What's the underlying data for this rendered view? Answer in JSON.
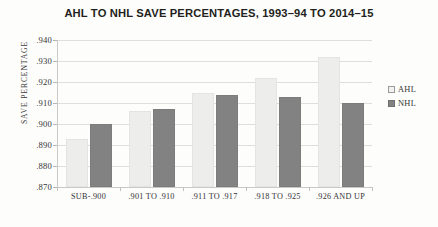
{
  "chart_data": {
    "type": "bar",
    "title": "AHL TO NHL SAVE PERCENTAGES, 1993–94 TO 2014–15",
    "xlabel": "",
    "ylabel": "SAVE PERCENTAGE",
    "ylim": [
      0.87,
      0.94
    ],
    "ytick_step": 0.01,
    "ytick_labels": [
      ".940",
      ".930",
      ".920",
      ".910",
      ".900",
      ".890",
      ".880",
      ".870"
    ],
    "ytick_values": [
      0.94,
      0.93,
      0.92,
      0.91,
      0.9,
      0.89,
      0.88,
      0.87
    ],
    "grid": true,
    "legend_position": "right",
    "categories": [
      "SUB-.900",
      ".901 TO .910",
      ".911 TO .917",
      ".918 TO .925",
      ".926 AND UP"
    ],
    "series": [
      {
        "name": "AHL",
        "color": "#ededec",
        "values": [
          0.893,
          0.906,
          0.915,
          0.922,
          0.932
        ]
      },
      {
        "name": "NHL",
        "color": "#828282",
        "values": [
          0.9,
          0.907,
          0.914,
          0.913,
          0.91
        ]
      }
    ]
  },
  "legend": {
    "items": [
      {
        "label": "AHL"
      },
      {
        "label": "NHL"
      }
    ]
  }
}
